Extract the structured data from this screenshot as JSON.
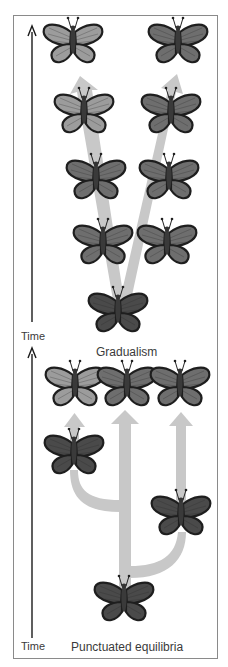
{
  "panels": [
    {
      "title": "Gradualism",
      "axis_label": "Time",
      "description": "Two lineages diverge gradually from a common ancestor, changing slowly over time"
    },
    {
      "title": "Punctuated equilibria",
      "axis_label": "Time",
      "description": "Lineages branch abruptly and then remain stable over long periods"
    }
  ],
  "colors": {
    "arrow": "#c8c8c8",
    "frame": "#8a8a8a",
    "axis": "#1a1a1a",
    "wing_light": "#9c9c9c",
    "wing_mid": "#6e6e6e",
    "wing_dark": "#4a4a4a",
    "wing_border": "#1e1e1e",
    "text": "#3a3a3a"
  },
  "butterflies": {
    "gradualism": [
      {
        "x": 73,
        "y": 42,
        "shade": "wing_light"
      },
      {
        "x": 178,
        "y": 42,
        "shade": "wing_mid"
      },
      {
        "x": 84,
        "y": 112,
        "shade": "wing_light"
      },
      {
        "x": 171,
        "y": 112,
        "shade": "wing_mid"
      },
      {
        "x": 96,
        "y": 178,
        "shade": "wing_mid"
      },
      {
        "x": 169,
        "y": 178,
        "shade": "wing_mid"
      },
      {
        "x": 103,
        "y": 243,
        "shade": "wing_mid"
      },
      {
        "x": 167,
        "y": 243,
        "shade": "wing_mid"
      },
      {
        "x": 118,
        "y": 311,
        "shade": "wing_dark"
      }
    ],
    "punctuated": [
      {
        "x": 75,
        "y": 385,
        "shade": "wing_light"
      },
      {
        "x": 127,
        "y": 385,
        "shade": "wing_mid"
      },
      {
        "x": 180,
        "y": 385,
        "shade": "wing_mid"
      },
      {
        "x": 74,
        "y": 453,
        "shade": "wing_dark"
      },
      {
        "x": 181,
        "y": 514,
        "shade": "wing_dark"
      },
      {
        "x": 124,
        "y": 600,
        "shade": "wing_dark"
      }
    ]
  }
}
